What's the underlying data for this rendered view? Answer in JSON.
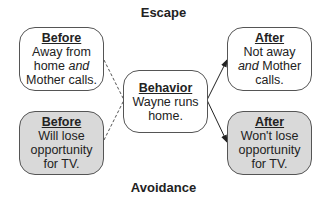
{
  "titles": {
    "top": "Escape",
    "bottom": "Avoidance"
  },
  "nodes": {
    "before_escape": {
      "heading": "Before",
      "lines": [
        "Away from",
        "home",
        "and",
        "Mother calls."
      ],
      "fill": "#ffffff"
    },
    "before_avoid": {
      "heading": "Before",
      "lines": [
        "Will lose",
        "opportunity",
        "for TV."
      ],
      "fill": "#d9d9d9"
    },
    "behavior": {
      "heading": "Behavior",
      "lines": [
        "Wayne runs",
        "home."
      ],
      "fill": "#ffffff"
    },
    "after_escape": {
      "heading": "After",
      "lines": [
        "Not away",
        "and",
        "Mother",
        "calls."
      ],
      "fill": "#ffffff"
    },
    "after_avoid": {
      "heading": "After",
      "lines": [
        "Won't lose",
        "opportunity",
        "for TV."
      ],
      "fill": "#d9d9d9"
    }
  },
  "edges": [
    {
      "from": "before_escape",
      "to": "behavior",
      "style": "dashed"
    },
    {
      "from": "before_avoid",
      "to": "behavior",
      "style": "dashed"
    },
    {
      "from": "behavior",
      "to": "after_escape",
      "style": "solid-arrow"
    },
    {
      "from": "behavior",
      "to": "after_avoid",
      "style": "solid-arrow"
    }
  ]
}
